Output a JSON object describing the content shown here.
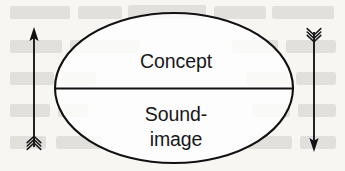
{
  "figure": {
    "name": "sign-model-diagram",
    "type": "diagram",
    "background_color": "#f7f6f3",
    "ink_color": "#111114",
    "labels": {
      "upper": "Concept",
      "lower_line1": "Sound-",
      "lower_line2": "image"
    },
    "shape": {
      "ellipse": {
        "center_x": 174,
        "center_y": 88,
        "radius_x": 119,
        "radius_y": 75,
        "stroke_width": 2.1
      },
      "divider": {
        "orientation": "horizontal",
        "y": 88.5,
        "x_start": 55,
        "x_end": 293
      }
    },
    "arrows": [
      {
        "name": "left-arrow",
        "direction": "up",
        "head_position": "top",
        "fletching_position": "bottom",
        "shaft_x": 34,
        "shaft_top_y": 31,
        "shaft_bottom_y": 147,
        "fletch_count": 3
      },
      {
        "name": "right-arrow",
        "direction": "down",
        "head_position": "bottom",
        "fletching_position": "top",
        "shaft_x": 314,
        "shaft_top_y": 30,
        "shaft_bottom_y": 148,
        "fletch_count": 3
      }
    ],
    "background_bleed": {
      "description": "faint mirrored show-through text from reverse of scanned page",
      "color": "#b8b4ae",
      "lines": [
        "",
        "",
        "",
        "",
        ""
      ]
    }
  }
}
